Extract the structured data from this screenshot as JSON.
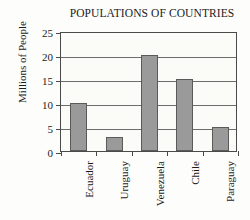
{
  "chart_data": {
    "type": "bar",
    "title": "POPULATIONS OF COUNTRIES",
    "xlabel": "",
    "ylabel": "Millions of People",
    "categories": [
      "Ecuador",
      "Uruguay",
      "Venezuela",
      "Chile",
      "Paraguay"
    ],
    "values": [
      10,
      3,
      20,
      15,
      5
    ],
    "ylim": [
      0,
      25
    ],
    "ytick_labels": [
      "0",
      "5",
      "10",
      "15",
      "20",
      "25"
    ],
    "ytick_values": [
      0,
      5,
      10,
      15,
      20,
      25
    ],
    "grid": "horizontal",
    "legend": "none",
    "bar_color": "#9a9a9a",
    "bar_edge_color": "#5a5a5a",
    "axis_color": "#4a4a4a",
    "grid_color": "#6d6d6d",
    "background_color": "#fdfdfb",
    "plot_background_color": "#fbfbf8"
  }
}
